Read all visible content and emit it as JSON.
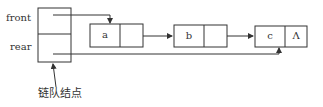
{
  "queue_node": {
    "fields": [
      {
        "label": "front"
      },
      {
        "label": "rear"
      }
    ],
    "caption": "链队结点"
  },
  "nodes": [
    {
      "data": "a",
      "next": ""
    },
    {
      "data": "b",
      "next": ""
    },
    {
      "data": "c",
      "next": "Λ"
    }
  ],
  "colors": {
    "line": "#333333",
    "background": "#ffffff"
  }
}
